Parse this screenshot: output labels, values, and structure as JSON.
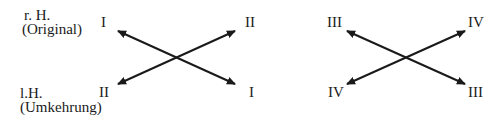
{
  "rows": {
    "top": {
      "hand": "r. H.",
      "description": "(Original)"
    },
    "bottom": {
      "hand": "l.H.",
      "description": "(Umkehrung)"
    }
  },
  "diagrams": [
    {
      "top_left": "I",
      "top_right": "II",
      "bottom_left": "II",
      "bottom_right": "I"
    },
    {
      "top_left": "III",
      "top_right": "IV",
      "bottom_left": "IV",
      "bottom_right": "III"
    }
  ],
  "colors": {
    "ink": "#1a1a1a",
    "background": "#ffffff"
  }
}
